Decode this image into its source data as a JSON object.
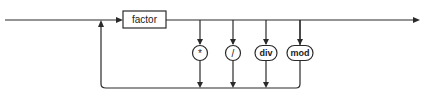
{
  "diagram": {
    "type": "syntax-diagram",
    "nonterminal": {
      "label": "factor"
    },
    "operators": [
      {
        "label": "*",
        "shape": "circle"
      },
      {
        "label": "/",
        "shape": "circle"
      },
      {
        "label": "div",
        "shape": "rounded"
      },
      {
        "label": "mod",
        "shape": "rounded"
      }
    ]
  }
}
